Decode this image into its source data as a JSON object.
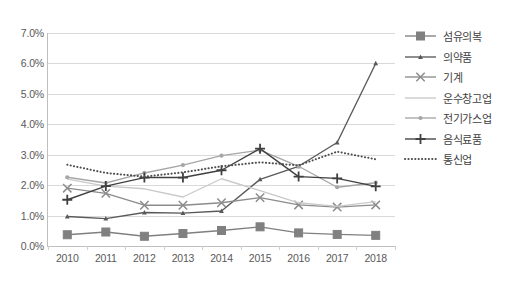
{
  "chart_data": {
    "type": "line",
    "title": "",
    "xlabel": "",
    "ylabel": "",
    "categories": [
      "2010",
      "2011",
      "2012",
      "2013",
      "2014",
      "2015",
      "2016",
      "2017",
      "2018"
    ],
    "ylim": [
      0,
      7
    ],
    "ytick_labels": [
      "0.0%",
      "1.0%",
      "2.0%",
      "3.0%",
      "4.0%",
      "5.0%",
      "6.0%",
      "7.0%"
    ],
    "ytick_values": [
      0,
      1,
      2,
      3,
      4,
      5,
      6,
      7
    ],
    "grid": "horizontal",
    "legend_position": "right",
    "series": [
      {
        "name": "섬유의복",
        "marker": "square",
        "color": "#808080",
        "line": "solid",
        "values": [
          0.37,
          0.46,
          0.32,
          0.41,
          0.51,
          0.63,
          0.43,
          0.38,
          0.35
        ]
      },
      {
        "name": "의약품",
        "marker": "small-triangle",
        "color": "#595959",
        "line": "solid",
        "values": [
          0.97,
          0.9,
          1.1,
          1.08,
          1.15,
          2.19,
          2.62,
          3.4,
          6.0
        ]
      },
      {
        "name": "기계",
        "marker": "x-cross",
        "color": "#8c8c8c",
        "line": "solid",
        "values": [
          1.9,
          1.73,
          1.34,
          1.34,
          1.42,
          1.59,
          1.35,
          1.28,
          1.35
        ]
      },
      {
        "name": "운수창고업",
        "marker": "none",
        "color": "#c9c9c9",
        "line": "solid",
        "values": [
          2.2,
          1.97,
          1.88,
          1.61,
          2.21,
          1.82,
          1.42,
          1.3,
          1.46
        ]
      },
      {
        "name": "전기가스업",
        "marker": "small-dot",
        "color": "#a6a6a6",
        "line": "solid",
        "values": [
          2.26,
          2.07,
          2.4,
          2.66,
          2.97,
          3.15,
          2.62,
          1.93,
          2.08
        ]
      },
      {
        "name": "음식료품",
        "marker": "plus",
        "color": "#404040",
        "line": "solid",
        "values": [
          1.52,
          1.97,
          2.25,
          2.25,
          2.49,
          3.2,
          2.28,
          2.22,
          1.96
        ]
      },
      {
        "name": "통신업",
        "marker": "none",
        "color": "#4d4d4d",
        "line": "dotted",
        "values": [
          2.67,
          2.4,
          2.28,
          2.42,
          2.62,
          2.75,
          2.65,
          3.1,
          2.85
        ]
      }
    ]
  }
}
